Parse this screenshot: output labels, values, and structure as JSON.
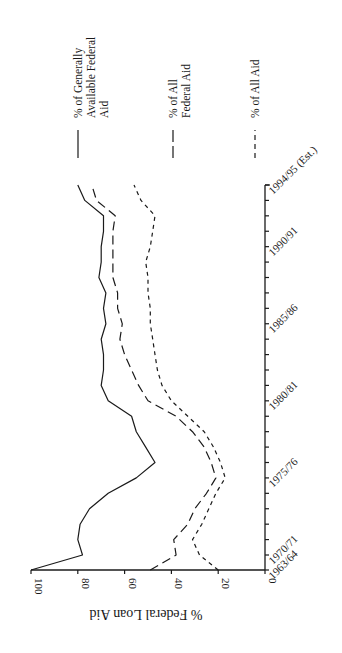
{
  "chart_data": {
    "type": "line",
    "orientation": "rotated-90-clockwise",
    "title": "",
    "xlabel": "",
    "ylabel": "% Federal Loan Aid",
    "ylim": [
      0,
      100
    ],
    "y_ticks": [
      "0",
      "20",
      "40",
      "60",
      "80",
      "100"
    ],
    "x_tick_labels": [
      "1963/64",
      "1970/71",
      "1975/76",
      "1980/81",
      "1985/86",
      "1990/91",
      "1994/95 (Est.)"
    ],
    "grid": false,
    "legend_position": "top (rotated)",
    "categories": [
      "1963/64",
      "1970/71",
      "1971/72",
      "1972/73",
      "1973/74",
      "1974/75",
      "1975/76",
      "1976/77",
      "1977/78",
      "1978/79",
      "1979/80",
      "1980/81",
      "1981/82",
      "1982/83",
      "1983/84",
      "1984/85",
      "1985/86",
      "1986/87",
      "1987/88",
      "1988/89",
      "1989/90",
      "1990/91",
      "1991/92",
      "1992/93",
      "1993/94",
      "1994/95"
    ],
    "series": [
      {
        "name": "% of Generally Available Federal Aid",
        "style": "solid",
        "values": [
          100,
          78,
          80,
          79,
          75,
          67,
          55,
          47,
          51,
          55,
          57,
          67,
          70,
          69,
          69,
          70,
          68,
          69,
          68,
          71,
          70,
          70,
          69,
          69,
          77,
          80
        ]
      },
      {
        "name": "% of All Federal Aid",
        "style": "long-dash",
        "values": [
          49,
          38,
          39,
          33,
          30,
          25,
          21,
          23,
          26,
          31,
          38,
          50,
          54,
          57,
          60,
          62,
          61,
          63,
          63,
          65,
          65,
          65,
          65,
          64,
          72,
          74
        ]
      },
      {
        "name": "% of All Aid",
        "style": "short-dash",
        "values": [
          20,
          28,
          31,
          27,
          24,
          21,
          17,
          19,
          22,
          26,
          33,
          40,
          44,
          46,
          47,
          48,
          49,
          49,
          50,
          50,
          51,
          49,
          48,
          47,
          53,
          56
        ]
      }
    ]
  },
  "legend": {
    "items": [
      {
        "lines": [
          "% of Generally",
          "Available Federal",
          "Aid"
        ],
        "style": "solid"
      },
      {
        "lines": [
          "% of All",
          "Federal Aid"
        ],
        "style": "long-dash"
      },
      {
        "lines": [
          "% of All Aid"
        ],
        "style": "short-dash"
      }
    ]
  },
  "axis": {
    "value_title": "% Federal Loan Aid"
  }
}
